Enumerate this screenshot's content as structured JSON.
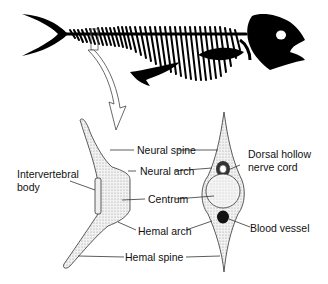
{
  "diagram": {
    "skeleton": {
      "description": "Fish skeleton silhouette with highlighted vertebra",
      "color": "#000000"
    },
    "labels": {
      "neural_spine": "Neural spine",
      "neural_arch": "Neural arch",
      "intervertebral_body_line1": "Intervertebral",
      "intervertebral_body_line2": "body",
      "centrum": "Centrum",
      "hemal_arch": "Hemal arch",
      "hemal_spine": "Hemal  spine",
      "dorsal_hollow_line1": "Dorsal hollow",
      "dorsal_hollow_line2": "nerve cord",
      "blood_vessel": "Blood vessel"
    },
    "colors": {
      "ink": "#111111",
      "stipple": "#cfcfcf",
      "background": "#ffffff"
    }
  }
}
